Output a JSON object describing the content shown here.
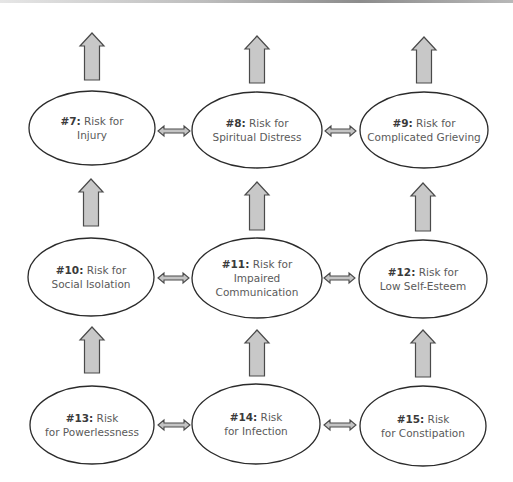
{
  "diagram": {
    "colors": {
      "ellipse_stroke": "#2b2b2b",
      "arrow_fill": "#c8c8c8",
      "arrow_stroke": "#4a4a4a",
      "label_number": "#3a3a3a",
      "label_text": "#5a5a5a"
    },
    "nodes": [
      {
        "id": "7",
        "number": "#7:",
        "lines": [
          "Risk for",
          "Injury"
        ],
        "cx": 92,
        "cy": 128,
        "rx": 63,
        "ry": 37
      },
      {
        "id": "8",
        "number": "#8:",
        "lines": [
          "Risk for",
          "Spiritual Distress"
        ],
        "cx": 257,
        "cy": 130,
        "rx": 65,
        "ry": 38
      },
      {
        "id": "9",
        "number": "#9:",
        "lines": [
          "Risk for",
          "Complicated Grieving"
        ],
        "cx": 424,
        "cy": 130,
        "rx": 64,
        "ry": 38
      },
      {
        "id": "10",
        "number": "#10:",
        "lines": [
          "Risk for",
          "Social Isolation"
        ],
        "cx": 91,
        "cy": 277,
        "rx": 63,
        "ry": 39
      },
      {
        "id": "11",
        "number": "#11:",
        "lines": [
          "Risk for",
          "Impaired",
          "Communication"
        ],
        "cx": 257,
        "cy": 278,
        "rx": 65,
        "ry": 40
      },
      {
        "id": "12",
        "number": "#12:",
        "lines": [
          "Risk for",
          "Low Self-Esteem"
        ],
        "cx": 423,
        "cy": 279,
        "rx": 64,
        "ry": 39
      },
      {
        "id": "13",
        "number": "#13:",
        "lines": [
          "Risk",
          "for Powerlessness"
        ],
        "cx": 92,
        "cy": 425,
        "rx": 62,
        "ry": 39
      },
      {
        "id": "14",
        "number": "#14:",
        "lines": [
          "Risk",
          "for Infection"
        ],
        "cx": 256,
        "cy": 424,
        "rx": 64,
        "ry": 40
      },
      {
        "id": "15",
        "number": "#15:",
        "lines": [
          "Risk",
          "for Constipation"
        ],
        "cx": 423,
        "cy": 426,
        "rx": 63,
        "ry": 40
      }
    ],
    "up_arrows": [
      {
        "from": "7",
        "to": "above",
        "cx": 92,
        "top": 33,
        "bottom": 80
      },
      {
        "from": "8",
        "to": "above",
        "cx": 257,
        "top": 36,
        "bottom": 83
      },
      {
        "from": "9",
        "to": "above",
        "cx": 424,
        "top": 37,
        "bottom": 83
      },
      {
        "from": "10",
        "to": "7",
        "cx": 91,
        "top": 179,
        "bottom": 226
      },
      {
        "from": "11",
        "to": "8",
        "cx": 257,
        "top": 182,
        "bottom": 230
      },
      {
        "from": "12",
        "to": "9",
        "cx": 423,
        "top": 183,
        "bottom": 231
      },
      {
        "from": "13",
        "to": "10",
        "cx": 92,
        "top": 327,
        "bottom": 373
      },
      {
        "from": "14",
        "to": "11",
        "cx": 257,
        "top": 330,
        "bottom": 376
      },
      {
        "from": "15",
        "to": "12",
        "cx": 423,
        "top": 330,
        "bottom": 377
      }
    ],
    "double_arrows": [
      {
        "between": [
          "7",
          "8"
        ],
        "x1": 158,
        "x2": 190,
        "cy": 131
      },
      {
        "between": [
          "8",
          "9"
        ],
        "x1": 325,
        "x2": 356,
        "cy": 131
      },
      {
        "between": [
          "10",
          "11"
        ],
        "x1": 158,
        "x2": 189,
        "cy": 278
      },
      {
        "between": [
          "11",
          "12"
        ],
        "x1": 324,
        "x2": 355,
        "cy": 278
      },
      {
        "between": [
          "13",
          "14"
        ],
        "x1": 158,
        "x2": 190,
        "cy": 425
      },
      {
        "between": [
          "14",
          "15"
        ],
        "x1": 324,
        "x2": 356,
        "cy": 425
      }
    ]
  }
}
